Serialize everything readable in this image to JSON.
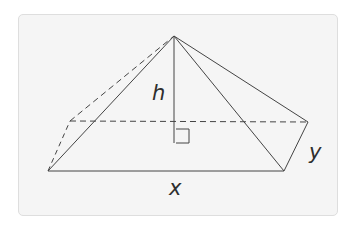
{
  "figure": {
    "type": "rectangular pyramid",
    "labels": {
      "height": "h",
      "length": "x",
      "width": "y"
    },
    "colors": {
      "line": "#444444",
      "card_fill": "#f5f5f5",
      "card_border": "#dedede"
    }
  }
}
